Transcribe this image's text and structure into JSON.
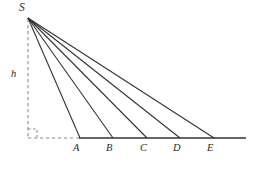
{
  "figure": {
    "name": "fan-of-rays-from-apex-to-baseline",
    "background_color": "#ffffff",
    "line_color": "#333333",
    "dashed_color": "#8c8c8c",
    "label_color": "#2b2b2b",
    "stroke_width": 1.1
  },
  "apex": {
    "label": "S",
    "x": 28,
    "y": 17,
    "label_x": 19,
    "label_y": 2
  },
  "height_segment": {
    "label": "h",
    "label_x": 11,
    "label_y": 69,
    "from_x": 28,
    "from_y": 19,
    "to_x": 28,
    "to_y": 138,
    "style": "dashed"
  },
  "right_angle_marker": {
    "name": "right-angle-square",
    "x": 28,
    "y": 138,
    "size": 9,
    "style": "dashed"
  },
  "foot_segment": {
    "name": "dashed-base-from-foot-to-A",
    "from_x": 28,
    "from_y": 138,
    "to_x": 80,
    "to_y": 138,
    "style": "dashed"
  },
  "baseline": {
    "name": "horizontal-baseline",
    "from_x": 79,
    "from_y": 138,
    "to_x": 246,
    "to_y": 138,
    "style": "solid"
  },
  "base_points": [
    {
      "label": "A",
      "x": 80,
      "y": 138,
      "label_x": 73,
      "label_y": 143
    },
    {
      "label": "B",
      "x": 113,
      "y": 138,
      "label_x": 106,
      "label_y": 143
    },
    {
      "label": "C",
      "x": 147,
      "y": 138,
      "label_x": 140,
      "label_y": 143
    },
    {
      "label": "D",
      "x": 180,
      "y": 138,
      "label_x": 173,
      "label_y": 143
    },
    {
      "label": "E",
      "x": 214,
      "y": 138,
      "label_x": 207,
      "label_y": 143
    }
  ],
  "rays": [
    {
      "name": "ray-S-to-A",
      "to_label": "A",
      "from_x": 28,
      "from_y": 18,
      "to_x": 80,
      "to_y": 138
    },
    {
      "name": "ray-S-to-B",
      "to_label": "B",
      "from_x": 28,
      "from_y": 18,
      "to_x": 113,
      "to_y": 138
    },
    {
      "name": "ray-S-to-C",
      "to_label": "C",
      "from_x": 28,
      "from_y": 18,
      "to_x": 147,
      "to_y": 138
    },
    {
      "name": "ray-S-to-D",
      "to_label": "D",
      "from_x": 28,
      "from_y": 18,
      "to_x": 180,
      "to_y": 138
    },
    {
      "name": "ray-S-to-E",
      "to_label": "E",
      "from_x": 28,
      "from_y": 18,
      "to_x": 214,
      "to_y": 138
    }
  ]
}
